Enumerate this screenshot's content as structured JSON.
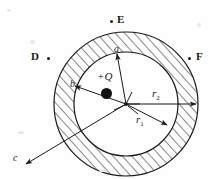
{
  "figure": {
    "background_color": "#fefefe",
    "ink_color": "#1a1a1a",
    "width": 215,
    "height": 179
  },
  "labels": {
    "point_d": "D",
    "point_e": "E",
    "point_f": "F",
    "charge": "+Q",
    "radius_a": "a",
    "radius_b": "b",
    "radius_c": "c",
    "radius_r1_base": "r",
    "radius_r1_sub": "1",
    "radius_r2_base": "r",
    "radius_r2_sub": "2"
  },
  "geometry": {
    "center_x": 126,
    "center_y": 104,
    "inner_radius": 52,
    "outer_radius": 72,
    "charge_x": 106,
    "charge_y": 85
  },
  "points": [
    {
      "name": "D",
      "dot_x": 48,
      "dot_y": 58,
      "label_x": 33,
      "label_y": 52
    },
    {
      "name": "E",
      "dot_x": 111,
      "dot_y": 21,
      "label_x": 117,
      "label_y": 15
    },
    {
      "name": "F",
      "dot_x": 189,
      "dot_y": 58,
      "label_x": 196,
      "label_y": 52
    }
  ],
  "arrows": [
    {
      "name": "a",
      "label": "a",
      "to_x": 117,
      "to_y": 53
    },
    {
      "name": "b",
      "label": "b",
      "to_x": 73,
      "to_y": 86
    },
    {
      "name": "c",
      "label": "c",
      "to_x": 25,
      "to_y": 165
    },
    {
      "name": "r1",
      "label": "r1",
      "to_x": 166,
      "to_y": 124
    },
    {
      "name": "r2",
      "label": "r2",
      "to_x": 195,
      "to_y": 104
    }
  ]
}
